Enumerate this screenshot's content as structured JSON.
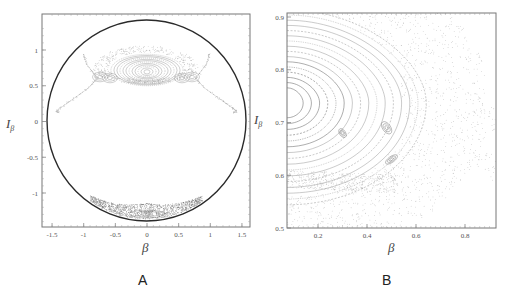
{
  "chart_data": [
    {
      "panel": "A",
      "type": "scatter",
      "title": "",
      "xlabel": "β",
      "ylabel": "I_β",
      "xlim": [
        -1.6,
        1.65
      ],
      "ylim": [
        -1.48,
        1.48
      ],
      "xticks": [
        -1.5,
        -1,
        -0.5,
        0,
        0.5,
        1,
        1.5
      ],
      "xtick_labels": [
        "-1.5",
        "-1",
        "-0.5",
        "0",
        "0.5",
        "1",
        "1.5"
      ],
      "yticks": [
        1,
        0.5,
        0,
        -0.5,
        -1
      ],
      "ytick_labels": [
        "1",
        "0.5",
        "0",
        "-0.5",
        "-1"
      ],
      "grid": false,
      "description": "Poincaré section: bounding energy circle with a stable island of nested orbits centered near (0, 0.72), separatrix lobes extending to (±1.4, 0.15), and a chaotic band near (0, -1.3).",
      "boundary": {
        "shape": "ellipse",
        "center": [
          0,
          0
        ],
        "rx": 1.58,
        "ry": 1.4
      },
      "island": {
        "center": [
          0,
          0.72
        ],
        "half_width": 0.6,
        "half_height": 0.22,
        "n_orbits": 12
      },
      "separatrix_xpoints": [
        [
          -0.8,
          0.6
        ],
        [
          0.8,
          0.6
        ]
      ],
      "separatrix_tails": [
        [
          -1.45,
          0.15
        ],
        [
          1.45,
          0.15
        ]
      ],
      "chaotic_band": {
        "center": [
          0,
          -1.3
        ],
        "half_width": 0.85,
        "half_height": 0.1
      }
    },
    {
      "panel": "B",
      "type": "scatter",
      "title": "",
      "xlabel": "β",
      "ylabel": "I_β",
      "xlim": [
        0.074,
        0.927
      ],
      "ylim": [
        0.5,
        0.91
      ],
      "xticks": [
        0.2,
        0.4,
        0.6,
        0.8
      ],
      "xtick_labels": [
        "0.2",
        "0.4",
        "0.6",
        "0.8"
      ],
      "yticks": [
        0.9,
        0.8,
        0.7,
        0.6,
        0.5
      ],
      "ytick_labels": [
        "0.9",
        "0.8",
        "0.7",
        "0.6",
        "0.5"
      ],
      "grid": false,
      "description": "Zoom of panel A near the island edge: nested orbits centered near (0.07, 0.72), secondary islands near (0.5, 0.63), and a chaotic X-shaped separatrix region near (0.8, 0.66).",
      "island": {
        "center": [
          0.07,
          0.72
        ],
        "n_orbits": 16
      },
      "secondary_islands": [
        [
          0.5,
          0.63
        ],
        [
          0.48,
          0.69
        ],
        [
          0.3,
          0.68
        ]
      ],
      "xpoint": [
        0.8,
        0.66
      ]
    }
  ],
  "figure": {
    "panel_labels": [
      "A",
      "B"
    ],
    "colors": {
      "boundary": "#2a2a2a",
      "orbit": "#8a8a8a",
      "frame": "#777777",
      "chaos": "#9a9a9a"
    }
  }
}
